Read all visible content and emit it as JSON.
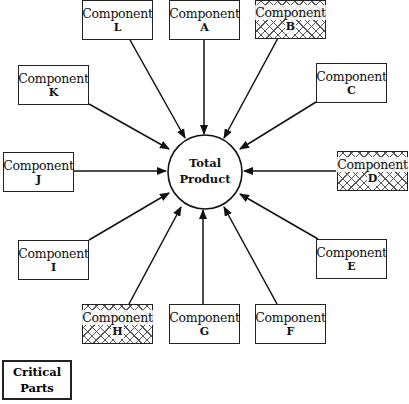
{
  "diagram": {
    "center": {
      "line1": "Total",
      "line2": "Product"
    },
    "components": [
      {
        "id": "L",
        "title": "Component",
        "letter": "L",
        "critical": false
      },
      {
        "id": "A",
        "title": "Component",
        "letter": "A",
        "critical": false
      },
      {
        "id": "B",
        "title": "Component",
        "letter": "B",
        "critical": true
      },
      {
        "id": "C",
        "title": "Component",
        "letter": "C",
        "critical": false
      },
      {
        "id": "D",
        "title": "Component",
        "letter": "D",
        "critical": true
      },
      {
        "id": "E",
        "title": "Component",
        "letter": "E",
        "critical": false
      },
      {
        "id": "F",
        "title": "Component",
        "letter": "F",
        "critical": false
      },
      {
        "id": "G",
        "title": "Component",
        "letter": "G",
        "critical": false
      },
      {
        "id": "H",
        "title": "Component",
        "letter": "H",
        "critical": true
      },
      {
        "id": "I",
        "title": "Component",
        "letter": "I",
        "critical": false
      },
      {
        "id": "J",
        "title": "Component",
        "letter": "J",
        "critical": false
      },
      {
        "id": "K",
        "title": "Component",
        "letter": "K",
        "critical": false
      }
    ],
    "legend": {
      "line1": "Critical",
      "line2": "Parts"
    }
  }
}
